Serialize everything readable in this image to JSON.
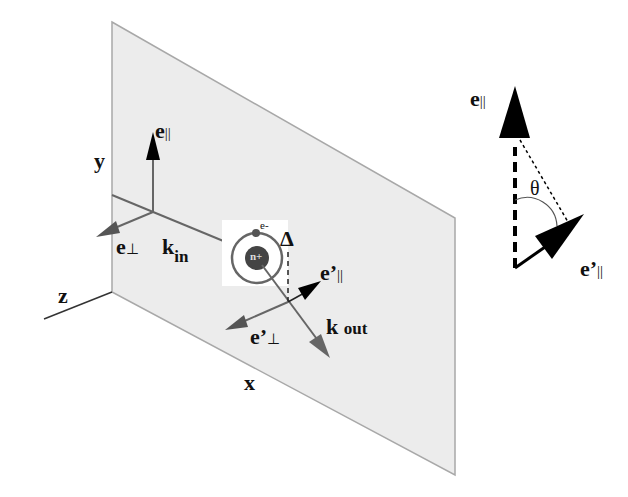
{
  "diagram": {
    "type": "scattering-geometry",
    "labels": {
      "y_axis": "y",
      "z_axis": "z",
      "x_axis": "x",
      "e_par_in": "e",
      "e_par_in_sub": "||",
      "e_perp_in": "e",
      "e_perp_in_sub": "⊥",
      "k_in": "k",
      "k_in_sub": "in",
      "electron": "e-",
      "ion": "n+",
      "delta": "Δ",
      "e_par_out": "e’",
      "e_par_out_sub": "||",
      "e_perp_out": "e’",
      "e_perp_out_sub": "⊥",
      "k_out": "k",
      "k_out_sub": "out",
      "inset_e_par": "e",
      "inset_e_par_sub": "||",
      "inset_theta": "θ",
      "inset_e_par_prime": "e’",
      "inset_e_par_prime_sub": "||"
    },
    "colors": {
      "plane_fill": "#ececec",
      "plane_edge": "#a8a8a8",
      "gray_arrow": "#666666",
      "black": "#000000"
    }
  }
}
